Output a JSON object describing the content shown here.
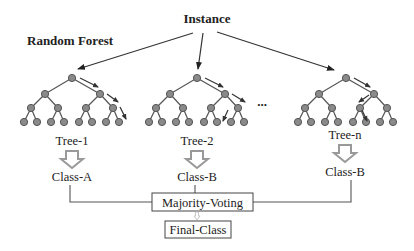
{
  "diagram": {
    "title": "Random Forest",
    "input_label": "Instance",
    "ellipsis": "...",
    "trees": [
      {
        "name": "Tree-1",
        "output": "Class-A",
        "root_x": 72
      },
      {
        "name": "Tree-2",
        "output": "Class-B",
        "root_x": 197
      },
      {
        "name": "Tree-n",
        "output": "Class-B",
        "root_x": 345
      }
    ],
    "aggregator": "Majority-Voting",
    "result": "Final-Class",
    "colors": {
      "node_fill": "#8a8a8a",
      "edge": "#555555",
      "class_arrow": "#999999",
      "text": "#222222"
    }
  }
}
